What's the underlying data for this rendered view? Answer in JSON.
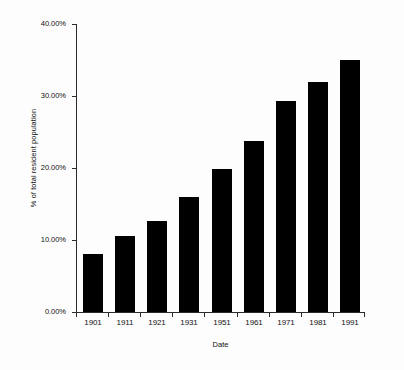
{
  "chart_data": {
    "type": "bar",
    "title": "",
    "xlabel": "Date",
    "ylabel": "% of total resident population",
    "categories": [
      "1901",
      "1911",
      "1921",
      "1931",
      "1951",
      "1961",
      "1971",
      "1981",
      "1991"
    ],
    "values": [
      8.0,
      10.5,
      12.7,
      16.0,
      19.9,
      23.8,
      29.3,
      32.0,
      35.0
    ],
    "ylim": [
      0,
      40
    ],
    "ytick_labels": [
      "0.00%",
      "10.00%",
      "20.00%",
      "30.00%",
      "40.00%"
    ],
    "ytick_values": [
      0,
      10,
      20,
      30,
      40
    ],
    "grid": false,
    "legend": false,
    "legend_position": "none",
    "bar_color": "#000000",
    "axis_color": "#2b2b2b",
    "background_color": "#ffffff"
  }
}
